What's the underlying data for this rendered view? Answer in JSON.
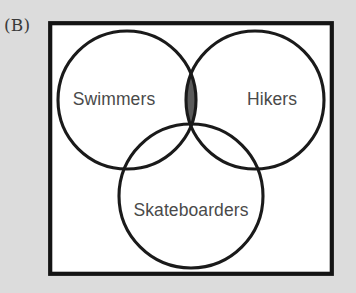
{
  "figure": {
    "panel_label": "(B)",
    "background_color": "#dcdcdc",
    "frame": {
      "fill_color": "#ffffff",
      "border_color": "#141414"
    }
  },
  "venn": {
    "type": "venn-3-circle",
    "stroke_color": "#1a1a1a",
    "shaded_fill_color": "#5a5a5a",
    "label_color": "#4a4a4a",
    "sets": [
      {
        "id": "swimmers",
        "label": "Swimmers",
        "position": "left",
        "cx": 79,
        "cy": 79,
        "r": 69,
        "label_x": 66,
        "label_y": 79
      },
      {
        "id": "hikers",
        "label": "Hikers",
        "position": "right",
        "cx": 207,
        "cy": 79,
        "r": 69,
        "label_x": 224,
        "label_y": 79
      },
      {
        "id": "skateboarders",
        "label": "Skateboarders",
        "position": "bottom",
        "cx": 143,
        "cy": 175,
        "r": 72,
        "label_x": 143,
        "label_y": 190
      }
    ],
    "shaded_regions": [
      {
        "id": "swimmers-and-hikers",
        "description": "Swimmers intersect Hikers",
        "fill": "#5a5a5a"
      }
    ]
  }
}
